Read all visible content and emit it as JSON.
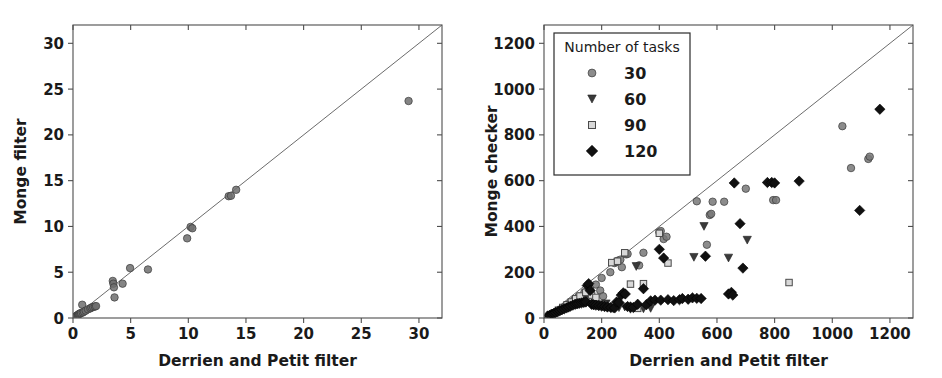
{
  "figure": {
    "background": "#ffffff",
    "width": 942,
    "height": 378
  },
  "chart_data": [
    {
      "panel": "left",
      "type": "scatter",
      "title": "",
      "xlabel": "Derrien and Petit filter",
      "ylabel": "Monge filter",
      "xlim": [
        0,
        32
      ],
      "ylim": [
        0,
        32
      ],
      "xticks": [
        0,
        5,
        10,
        15,
        20,
        25,
        30
      ],
      "yticks": [
        0,
        5,
        10,
        15,
        20,
        25,
        30
      ],
      "xticklabels": [
        "0",
        "5",
        "10",
        "15",
        "20",
        "25",
        "30"
      ],
      "yticklabels": [
        "0",
        "5",
        "10",
        "15",
        "20",
        "25",
        "30"
      ],
      "grid": false,
      "legend": null,
      "reference_line": {
        "type": "identity",
        "from": [
          0,
          0
        ],
        "to": [
          32,
          32
        ],
        "color": "#5a5a5a"
      },
      "series": [
        {
          "name": "runs",
          "marker": "circle",
          "color": "#6e6e6e",
          "points": [
            [
              0.15,
              0.1
            ],
            [
              0.2,
              0.15
            ],
            [
              0.28,
              0.2
            ],
            [
              0.33,
              0.25
            ],
            [
              0.4,
              0.3
            ],
            [
              0.45,
              0.35
            ],
            [
              0.5,
              0.4
            ],
            [
              0.55,
              0.45
            ],
            [
              0.62,
              0.5
            ],
            [
              0.7,
              0.55
            ],
            [
              0.8,
              1.45
            ],
            [
              0.85,
              0.6
            ],
            [
              0.95,
              0.7
            ],
            [
              1.1,
              0.8
            ],
            [
              1.3,
              0.95
            ],
            [
              1.5,
              1.05
            ],
            [
              1.6,
              1.15
            ],
            [
              1.75,
              1.2
            ],
            [
              1.9,
              1.25
            ],
            [
              2.0,
              1.3
            ],
            [
              3.45,
              4.05
            ],
            [
              3.5,
              3.75
            ],
            [
              3.55,
              3.35
            ],
            [
              3.6,
              2.25
            ],
            [
              4.3,
              3.75
            ],
            [
              4.95,
              5.45
            ],
            [
              6.5,
              5.3
            ],
            [
              9.9,
              8.7
            ],
            [
              10.2,
              9.95
            ],
            [
              10.35,
              9.8
            ],
            [
              13.5,
              13.3
            ],
            [
              13.7,
              13.35
            ],
            [
              14.15,
              14.0
            ],
            [
              29.1,
              23.7
            ]
          ]
        }
      ]
    },
    {
      "panel": "right",
      "type": "scatter",
      "title": "",
      "xlabel": "Derrien and Petit filter",
      "ylabel": "Monge checker",
      "xlim": [
        0,
        1280
      ],
      "ylim": [
        0,
        1280
      ],
      "xticks": [
        0,
        200,
        400,
        600,
        800,
        1000,
        1200
      ],
      "yticks": [
        0,
        200,
        400,
        600,
        800,
        1000,
        1200
      ],
      "xticklabels": [
        "0",
        "200",
        "400",
        "600",
        "800",
        "1000",
        "1200"
      ],
      "yticklabels": [
        "0",
        "200",
        "400",
        "600",
        "800",
        "1000",
        "1200"
      ],
      "grid": false,
      "reference_line": {
        "type": "identity",
        "from": [
          0,
          0
        ],
        "to": [
          1280,
          1280
        ],
        "color": "#5a5a5a"
      },
      "legend": {
        "title": "Number of tasks",
        "position": "upper-left",
        "entries": [
          {
            "label": "30",
            "marker": "circle",
            "color": "#787878"
          },
          {
            "label": "60",
            "marker": "triangle-down",
            "color": "#3a3a3a"
          },
          {
            "label": "90",
            "marker": "square-open",
            "color": "#8a8a8a"
          },
          {
            "label": "120",
            "marker": "diamond",
            "color": "#101010"
          }
        ]
      },
      "series": [
        {
          "name": "30",
          "marker": "circle",
          "color": "#787878",
          "points": [
            [
              30,
              18
            ],
            [
              45,
              28
            ],
            [
              60,
              40
            ],
            [
              75,
              52
            ],
            [
              90,
              66
            ],
            [
              105,
              80
            ],
            [
              120,
              94
            ],
            [
              140,
              112
            ],
            [
              160,
              130
            ],
            [
              180,
              146
            ],
            [
              195,
              120
            ],
            [
              200,
              175
            ],
            [
              205,
              95
            ],
            [
              230,
              200
            ],
            [
              245,
              240
            ],
            [
              250,
              245
            ],
            [
              255,
              250
            ],
            [
              265,
              255
            ],
            [
              270,
              222
            ],
            [
              285,
              278
            ],
            [
              290,
              280
            ],
            [
              330,
              230
            ],
            [
              345,
              285
            ],
            [
              400,
              375
            ],
            [
              405,
              380
            ],
            [
              415,
              345
            ],
            [
              425,
              355
            ],
            [
              530,
              510
            ],
            [
              565,
              320
            ],
            [
              575,
              450
            ],
            [
              580,
              455
            ],
            [
              585,
              508
            ],
            [
              625,
              508
            ],
            [
              700,
              565
            ],
            [
              795,
              515
            ],
            [
              805,
              515
            ],
            [
              1035,
              838
            ],
            [
              1065,
              655
            ],
            [
              1125,
              695
            ],
            [
              1130,
              705
            ]
          ]
        },
        {
          "name": "60",
          "marker": "triangle-down",
          "color": "#3a3a3a",
          "points": [
            [
              25,
              12
            ],
            [
              40,
              20
            ],
            [
              55,
              30
            ],
            [
              70,
              38
            ],
            [
              85,
              48
            ],
            [
              100,
              56
            ],
            [
              115,
              64
            ],
            [
              130,
              72
            ],
            [
              150,
              80
            ],
            [
              170,
              60
            ],
            [
              185,
              55
            ],
            [
              200,
              58
            ],
            [
              215,
              62
            ],
            [
              240,
              40
            ],
            [
              260,
              45
            ],
            [
              280,
              48
            ],
            [
              300,
              38
            ],
            [
              320,
              225
            ],
            [
              345,
              40
            ],
            [
              370,
              42
            ],
            [
              520,
              265
            ],
            [
              555,
              400
            ],
            [
              640,
              262
            ],
            [
              705,
              340
            ]
          ]
        },
        {
          "name": "90",
          "marker": "square-open",
          "color": "#8a8a8a",
          "points": [
            [
              35,
              22
            ],
            [
              50,
              34
            ],
            [
              65,
              46
            ],
            [
              80,
              58
            ],
            [
              95,
              70
            ],
            [
              110,
              84
            ],
            [
              125,
              96
            ],
            [
              145,
              112
            ],
            [
              165,
              100
            ],
            [
              180,
              90
            ],
            [
              200,
              55
            ],
            [
              220,
              50
            ],
            [
              235,
              242
            ],
            [
              255,
              248
            ],
            [
              280,
              285
            ],
            [
              300,
              148
            ],
            [
              325,
              42
            ],
            [
              345,
              150
            ],
            [
              400,
              370
            ],
            [
              430,
              240
            ],
            [
              850,
              155
            ]
          ]
        },
        {
          "name": "120",
          "marker": "diamond",
          "color": "#101010",
          "points": [
            [
              12,
              8
            ],
            [
              20,
              12
            ],
            [
              28,
              16
            ],
            [
              34,
              20
            ],
            [
              40,
              24
            ],
            [
              48,
              28
            ],
            [
              55,
              32
            ],
            [
              62,
              36
            ],
            [
              70,
              40
            ],
            [
              78,
              44
            ],
            [
              85,
              48
            ],
            [
              92,
              52
            ],
            [
              100,
              56
            ],
            [
              108,
              60
            ],
            [
              115,
              62
            ],
            [
              122,
              64
            ],
            [
              130,
              66
            ],
            [
              138,
              68
            ],
            [
              145,
              70
            ],
            [
              150,
              142
            ],
            [
              155,
              150
            ],
            [
              160,
              120
            ],
            [
              165,
              60
            ],
            [
              172,
              58
            ],
            [
              180,
              56
            ],
            [
              190,
              54
            ],
            [
              200,
              52
            ],
            [
              210,
              50
            ],
            [
              220,
              48
            ],
            [
              232,
              46
            ],
            [
              245,
              44
            ],
            [
              252,
              70
            ],
            [
              260,
              68
            ],
            [
              268,
              100
            ],
            [
              275,
              110
            ],
            [
              282,
              105
            ],
            [
              290,
              50
            ],
            [
              300,
              48
            ],
            [
              310,
              46
            ],
            [
              325,
              60
            ],
            [
              345,
              128
            ],
            [
              355,
              58
            ],
            [
              370,
              75
            ],
            [
              385,
              78
            ],
            [
              400,
              300
            ],
            [
              405,
              78
            ],
            [
              415,
              262
            ],
            [
              430,
              80
            ],
            [
              450,
              76
            ],
            [
              470,
              80
            ],
            [
              480,
              85
            ],
            [
              500,
              82
            ],
            [
              515,
              88
            ],
            [
              530,
              86
            ],
            [
              545,
              85
            ],
            [
              560,
              270
            ],
            [
              640,
              105
            ],
            [
              650,
              112
            ],
            [
              655,
              100
            ],
            [
              660,
              590
            ],
            [
              680,
              412
            ],
            [
              690,
              218
            ],
            [
              775,
              592
            ],
            [
              790,
              592
            ],
            [
              800,
              590
            ],
            [
              885,
              598
            ],
            [
              1095,
              470
            ],
            [
              1165,
              912
            ]
          ]
        }
      ]
    }
  ]
}
